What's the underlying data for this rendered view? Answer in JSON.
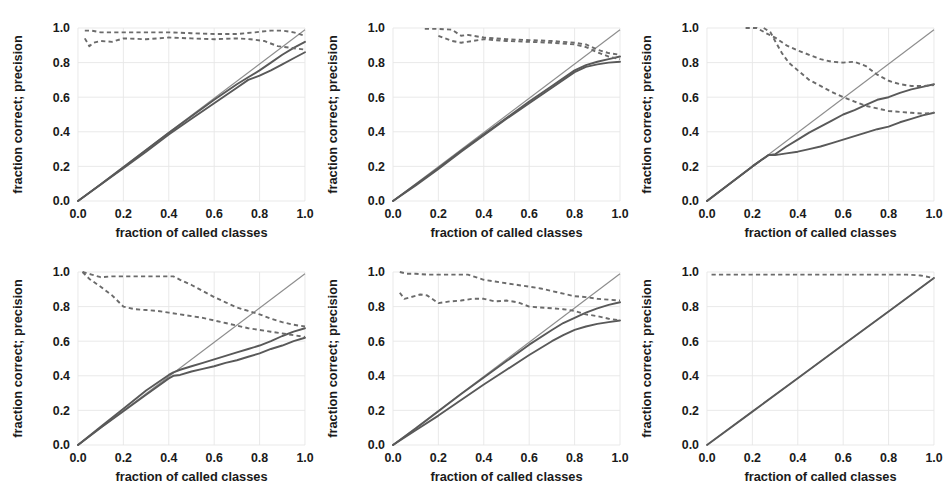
{
  "figure": {
    "layout": {
      "rows": 2,
      "cols": 3,
      "panel_count": 6
    },
    "colors": {
      "background": "#ffffff",
      "grid": "#e6e6e6",
      "diagonal": "#8d8d8d",
      "solid_curve": "#595959",
      "dashed_curve": "#6b6b6b",
      "text": "#1a1a1a"
    }
  },
  "axes": {
    "xlabel": "fraction of called classes",
    "ylabel": "fraction correct;  precision",
    "xticks": [
      "0.0",
      "0.2",
      "0.4",
      "0.6",
      "0.8",
      "1.0"
    ],
    "yticks": [
      "0.0",
      "0.2",
      "0.4",
      "0.6",
      "0.8",
      "1.0"
    ],
    "xlim": [
      0.0,
      1.0
    ],
    "ylim": [
      0.0,
      1.0
    ],
    "grid": true,
    "legend": "none"
  },
  "chart_data": [
    {
      "type": "line",
      "panel": 1,
      "title": "",
      "xlabel": "fraction of called classes",
      "ylabel": "fraction correct;  precision",
      "xlim": [
        0.0,
        1.0
      ],
      "ylim": [
        0.0,
        1.0
      ],
      "series": [
        {
          "name": "diagonal-reference",
          "style": "solid-thin",
          "x": [
            0.0,
            1.0
          ],
          "values": [
            0.0,
            0.99
          ]
        },
        {
          "name": "fraction-correct-upper",
          "style": "solid",
          "x": [
            0.0,
            0.1,
            0.2,
            0.3,
            0.4,
            0.5,
            0.6,
            0.7,
            0.75,
            0.8,
            0.85,
            0.9,
            0.95,
            1.0
          ],
          "values": [
            0.0,
            0.095,
            0.195,
            0.295,
            0.395,
            0.49,
            0.585,
            0.675,
            0.715,
            0.755,
            0.8,
            0.845,
            0.885,
            0.92
          ]
        },
        {
          "name": "fraction-correct-lower",
          "style": "solid",
          "x": [
            0.0,
            0.1,
            0.2,
            0.3,
            0.4,
            0.5,
            0.6,
            0.65,
            0.7,
            0.75,
            0.8,
            0.85,
            0.9,
            0.95,
            1.0
          ],
          "values": [
            0.0,
            0.095,
            0.19,
            0.285,
            0.385,
            0.475,
            0.565,
            0.61,
            0.655,
            0.7,
            0.725,
            0.755,
            0.79,
            0.825,
            0.86
          ]
        },
        {
          "name": "precision-upper",
          "style": "dashed",
          "x": [
            0.03,
            0.06,
            0.1,
            0.2,
            0.3,
            0.4,
            0.5,
            0.6,
            0.7,
            0.78,
            0.85,
            0.9,
            0.95,
            1.0
          ],
          "values": [
            0.985,
            0.985,
            0.975,
            0.975,
            0.975,
            0.975,
            0.97,
            0.965,
            0.965,
            0.975,
            0.985,
            0.985,
            0.975,
            0.955
          ]
        },
        {
          "name": "precision-lower",
          "style": "dashed",
          "x": [
            0.03,
            0.05,
            0.07,
            0.1,
            0.15,
            0.2,
            0.3,
            0.4,
            0.5,
            0.6,
            0.7,
            0.76,
            0.82,
            0.88,
            0.94,
            1.0
          ],
          "values": [
            0.94,
            0.895,
            0.915,
            0.925,
            0.92,
            0.94,
            0.935,
            0.945,
            0.94,
            0.935,
            0.94,
            0.935,
            0.925,
            0.895,
            0.885,
            0.875
          ]
        }
      ]
    },
    {
      "type": "line",
      "panel": 2,
      "title": "",
      "xlabel": "fraction of called classes",
      "ylabel": "fraction correct;  precision",
      "xlim": [
        0.0,
        1.0
      ],
      "ylim": [
        0.0,
        1.0
      ],
      "series": [
        {
          "name": "diagonal-reference",
          "style": "solid-thin",
          "x": [
            0.0,
            1.0
          ],
          "values": [
            0.0,
            0.99
          ]
        },
        {
          "name": "fraction-correct-upper",
          "style": "solid",
          "x": [
            0.0,
            0.1,
            0.2,
            0.3,
            0.4,
            0.5,
            0.6,
            0.7,
            0.8,
            0.85,
            0.9,
            0.95,
            1.0
          ],
          "values": [
            0.0,
            0.095,
            0.19,
            0.29,
            0.385,
            0.48,
            0.575,
            0.665,
            0.755,
            0.785,
            0.805,
            0.82,
            0.835
          ]
        },
        {
          "name": "fraction-correct-lower",
          "style": "solid",
          "x": [
            0.0,
            0.1,
            0.2,
            0.3,
            0.4,
            0.5,
            0.6,
            0.7,
            0.8,
            0.85,
            0.9,
            0.95,
            1.0
          ],
          "values": [
            0.0,
            0.09,
            0.185,
            0.285,
            0.38,
            0.475,
            0.565,
            0.655,
            0.745,
            0.775,
            0.79,
            0.8,
            0.805
          ]
        },
        {
          "name": "precision-upper",
          "style": "dashed",
          "x": [
            0.14,
            0.2,
            0.26,
            0.3,
            0.33,
            0.4,
            0.5,
            0.6,
            0.7,
            0.8,
            0.85,
            0.9,
            0.95,
            1.0
          ],
          "values": [
            0.995,
            0.995,
            0.99,
            0.955,
            0.96,
            0.945,
            0.935,
            0.93,
            0.925,
            0.915,
            0.905,
            0.875,
            0.855,
            0.845
          ]
        },
        {
          "name": "precision-lower",
          "style": "dashed",
          "x": [
            0.2,
            0.26,
            0.3,
            0.35,
            0.4,
            0.5,
            0.6,
            0.7,
            0.8,
            0.85,
            0.9,
            0.95,
            1.0
          ],
          "values": [
            0.955,
            0.925,
            0.915,
            0.925,
            0.935,
            0.925,
            0.92,
            0.915,
            0.905,
            0.89,
            0.86,
            0.835,
            0.82
          ]
        }
      ]
    },
    {
      "type": "line",
      "panel": 3,
      "title": "",
      "xlabel": "fraction of called classes",
      "ylabel": "fraction correct;  precision",
      "xlim": [
        0.0,
        1.0
      ],
      "ylim": [
        0.0,
        1.0
      ],
      "series": [
        {
          "name": "diagonal-reference",
          "style": "solid-thin",
          "x": [
            0.0,
            1.0
          ],
          "values": [
            0.0,
            0.99
          ]
        },
        {
          "name": "fraction-correct-upper",
          "style": "solid",
          "x": [
            0.0,
            0.1,
            0.2,
            0.27,
            0.3,
            0.35,
            0.4,
            0.45,
            0.5,
            0.55,
            0.6,
            0.65,
            0.7,
            0.75,
            0.8,
            0.85,
            0.9,
            0.95,
            1.0
          ],
          "values": [
            0.0,
            0.1,
            0.2,
            0.265,
            0.27,
            0.315,
            0.355,
            0.395,
            0.43,
            0.465,
            0.5,
            0.525,
            0.555,
            0.585,
            0.6,
            0.625,
            0.645,
            0.66,
            0.675
          ]
        },
        {
          "name": "fraction-correct-lower",
          "style": "solid",
          "x": [
            0.0,
            0.1,
            0.2,
            0.27,
            0.3,
            0.35,
            0.4,
            0.45,
            0.5,
            0.55,
            0.6,
            0.65,
            0.7,
            0.75,
            0.8,
            0.85,
            0.9,
            0.95,
            1.0
          ],
          "values": [
            0.0,
            0.1,
            0.2,
            0.265,
            0.265,
            0.275,
            0.285,
            0.3,
            0.315,
            0.335,
            0.355,
            0.375,
            0.395,
            0.415,
            0.43,
            0.455,
            0.475,
            0.495,
            0.51
          ]
        },
        {
          "name": "precision-upper",
          "style": "dashed",
          "x": [
            0.17,
            0.22,
            0.26,
            0.3,
            0.35,
            0.4,
            0.45,
            0.5,
            0.55,
            0.6,
            0.65,
            0.7,
            0.75,
            0.8,
            0.85,
            0.9,
            0.95,
            1.0
          ],
          "values": [
            1.0,
            1.0,
            0.97,
            0.945,
            0.9,
            0.87,
            0.845,
            0.82,
            0.805,
            0.8,
            0.805,
            0.78,
            0.73,
            0.695,
            0.675,
            0.665,
            0.665,
            0.67
          ]
        },
        {
          "name": "precision-lower",
          "style": "dashed",
          "x": [
            0.25,
            0.28,
            0.3,
            0.33,
            0.36,
            0.4,
            0.45,
            0.5,
            0.55,
            0.6,
            0.65,
            0.7,
            0.75,
            0.8,
            0.85,
            0.9,
            0.95,
            1.0
          ],
          "values": [
            1.0,
            0.975,
            0.925,
            0.855,
            0.8,
            0.755,
            0.7,
            0.665,
            0.63,
            0.6,
            0.575,
            0.55,
            0.535,
            0.52,
            0.515,
            0.51,
            0.505,
            0.51
          ]
        }
      ]
    },
    {
      "type": "line",
      "panel": 4,
      "title": "",
      "xlabel": "fraction of called classes",
      "ylabel": "fraction correct;  precision",
      "xlim": [
        0.0,
        1.0
      ],
      "ylim": [
        0.0,
        1.0
      ],
      "series": [
        {
          "name": "diagonal-reference",
          "style": "solid-thin",
          "x": [
            0.0,
            1.0
          ],
          "values": [
            0.0,
            0.99
          ]
        },
        {
          "name": "fraction-correct-upper",
          "style": "solid",
          "x": [
            0.0,
            0.1,
            0.2,
            0.3,
            0.4,
            0.42,
            0.45,
            0.5,
            0.55,
            0.6,
            0.65,
            0.7,
            0.75,
            0.8,
            0.85,
            0.9,
            0.95,
            1.0
          ],
          "values": [
            0.0,
            0.105,
            0.21,
            0.315,
            0.405,
            0.42,
            0.435,
            0.455,
            0.475,
            0.495,
            0.515,
            0.535,
            0.555,
            0.575,
            0.6,
            0.63,
            0.655,
            0.675
          ]
        },
        {
          "name": "fraction-correct-lower",
          "style": "solid",
          "x": [
            0.0,
            0.1,
            0.2,
            0.3,
            0.4,
            0.42,
            0.45,
            0.5,
            0.55,
            0.6,
            0.65,
            0.7,
            0.75,
            0.8,
            0.85,
            0.9,
            0.95,
            1.0
          ],
          "values": [
            0.0,
            0.1,
            0.195,
            0.29,
            0.385,
            0.4,
            0.405,
            0.425,
            0.44,
            0.455,
            0.475,
            0.49,
            0.51,
            0.53,
            0.555,
            0.575,
            0.6,
            0.62
          ]
        },
        {
          "name": "precision-upper",
          "style": "dashed",
          "x": [
            0.02,
            0.06,
            0.1,
            0.15,
            0.2,
            0.28,
            0.35,
            0.42,
            0.45,
            0.5,
            0.55,
            0.6,
            0.65,
            0.7,
            0.75,
            0.8,
            0.85,
            0.9,
            0.95,
            1.0
          ],
          "values": [
            1.0,
            0.985,
            0.97,
            0.975,
            0.975,
            0.975,
            0.975,
            0.975,
            0.955,
            0.925,
            0.89,
            0.855,
            0.825,
            0.795,
            0.775,
            0.755,
            0.73,
            0.71,
            0.695,
            0.685
          ]
        },
        {
          "name": "precision-lower",
          "style": "dashed",
          "x": [
            0.02,
            0.05,
            0.1,
            0.15,
            0.2,
            0.25,
            0.3,
            0.35,
            0.4,
            0.45,
            0.5,
            0.55,
            0.6,
            0.65,
            0.7,
            0.75,
            0.8,
            0.85,
            0.9,
            0.95,
            1.0
          ],
          "values": [
            1.0,
            0.96,
            0.915,
            0.865,
            0.8,
            0.785,
            0.78,
            0.775,
            0.765,
            0.755,
            0.745,
            0.735,
            0.72,
            0.705,
            0.69,
            0.675,
            0.665,
            0.655,
            0.645,
            0.635,
            0.625
          ]
        }
      ]
    },
    {
      "type": "line",
      "panel": 5,
      "title": "",
      "xlabel": "fraction of called classes",
      "ylabel": "fraction correct;  precision",
      "xlim": [
        0.0,
        1.0
      ],
      "ylim": [
        0.0,
        1.0
      ],
      "series": [
        {
          "name": "diagonal-reference",
          "style": "solid-thin",
          "x": [
            0.0,
            1.0
          ],
          "values": [
            0.0,
            0.99
          ]
        },
        {
          "name": "fraction-correct-upper",
          "style": "solid",
          "x": [
            0.0,
            0.1,
            0.2,
            0.3,
            0.4,
            0.5,
            0.6,
            0.7,
            0.75,
            0.8,
            0.85,
            0.9,
            0.95,
            1.0
          ],
          "values": [
            0.0,
            0.095,
            0.195,
            0.295,
            0.39,
            0.485,
            0.58,
            0.665,
            0.705,
            0.735,
            0.765,
            0.79,
            0.81,
            0.825
          ]
        },
        {
          "name": "fraction-correct-lower",
          "style": "solid",
          "x": [
            0.0,
            0.1,
            0.2,
            0.3,
            0.4,
            0.5,
            0.6,
            0.7,
            0.75,
            0.8,
            0.85,
            0.9,
            0.95,
            1.0
          ],
          "values": [
            0.0,
            0.085,
            0.17,
            0.26,
            0.35,
            0.435,
            0.52,
            0.6,
            0.635,
            0.665,
            0.685,
            0.7,
            0.71,
            0.72
          ]
        },
        {
          "name": "precision-upper",
          "style": "dashed",
          "x": [
            0.03,
            0.06,
            0.1,
            0.15,
            0.2,
            0.25,
            0.3,
            0.33,
            0.4,
            0.45,
            0.5,
            0.55,
            0.6,
            0.65,
            0.7,
            0.75,
            0.8,
            0.85,
            0.9,
            0.95,
            1.0
          ],
          "values": [
            1.0,
            0.99,
            0.99,
            0.985,
            0.985,
            0.985,
            0.985,
            0.985,
            0.955,
            0.945,
            0.935,
            0.925,
            0.915,
            0.905,
            0.89,
            0.875,
            0.86,
            0.855,
            0.845,
            0.84,
            0.835
          ]
        },
        {
          "name": "precision-lower",
          "style": "dashed",
          "x": [
            0.03,
            0.05,
            0.08,
            0.12,
            0.15,
            0.2,
            0.25,
            0.3,
            0.35,
            0.4,
            0.45,
            0.5,
            0.55,
            0.6,
            0.65,
            0.7,
            0.75,
            0.8,
            0.85,
            0.9,
            0.95,
            1.0
          ],
          "values": [
            0.88,
            0.845,
            0.855,
            0.87,
            0.865,
            0.82,
            0.83,
            0.835,
            0.845,
            0.845,
            0.83,
            0.835,
            0.825,
            0.8,
            0.795,
            0.79,
            0.785,
            0.775,
            0.755,
            0.745,
            0.73,
            0.72
          ]
        }
      ]
    },
    {
      "type": "line",
      "panel": 6,
      "title": "",
      "xlabel": "fraction of called classes",
      "ylabel": "fraction correct;  precision",
      "xlim": [
        0.0,
        1.0
      ],
      "ylim": [
        0.0,
        1.0
      ],
      "series": [
        {
          "name": "diagonal-reference",
          "style": "solid-thin",
          "x": [
            0.0,
            1.0
          ],
          "values": [
            0.0,
            0.965
          ]
        },
        {
          "name": "fraction-correct",
          "style": "solid",
          "x": [
            0.0,
            0.2,
            0.4,
            0.6,
            0.8,
            1.0
          ],
          "values": [
            0.0,
            0.193,
            0.386,
            0.579,
            0.772,
            0.965
          ]
        },
        {
          "name": "precision",
          "style": "dashed",
          "x": [
            0.02,
            0.1,
            0.2,
            0.3,
            0.4,
            0.5,
            0.6,
            0.7,
            0.8,
            0.88,
            0.94,
            1.0
          ],
          "values": [
            0.985,
            0.985,
            0.985,
            0.985,
            0.985,
            0.985,
            0.985,
            0.985,
            0.985,
            0.985,
            0.98,
            0.965
          ]
        }
      ]
    }
  ]
}
